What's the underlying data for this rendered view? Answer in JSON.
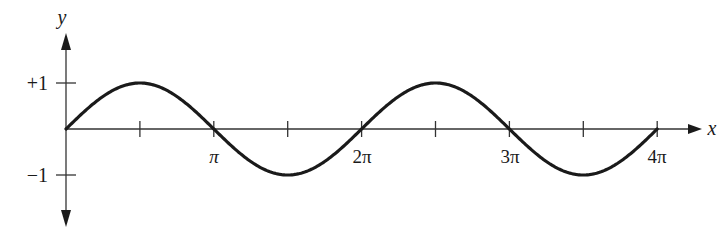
{
  "chart_data": {
    "type": "line",
    "title": "",
    "function": "y = sin(x)",
    "xlabel": "x",
    "ylabel": "y",
    "x_tick_labels": [
      "π",
      "2π",
      "3π",
      "4π"
    ],
    "x_ticks": [
      0.5,
      1,
      1.5,
      2,
      2.5,
      3,
      3.5,
      4
    ],
    "x_ticks_unit": "pi",
    "y_tick_labels": [
      "+1",
      "−1"
    ],
    "y_ticks": [
      1,
      -1
    ],
    "xlim": [
      0,
      12.566
    ],
    "ylim": [
      -1,
      1
    ],
    "grid": false,
    "legend": null,
    "series": [
      {
        "name": "sin x",
        "x": [
          0,
          0.785,
          1.571,
          2.356,
          3.142,
          3.927,
          4.712,
          5.498,
          6.283,
          7.069,
          7.854,
          8.639,
          9.425,
          10.21,
          10.996,
          11.781,
          12.566
        ],
        "values": [
          0,
          0.707,
          1,
          0.707,
          0,
          -0.707,
          -1,
          -0.707,
          0,
          0.707,
          1,
          0.707,
          0,
          -0.707,
          -1,
          -0.707,
          0
        ]
      }
    ],
    "colors": {
      "curve": "#1a1a1a",
      "axis": "#333333"
    }
  }
}
